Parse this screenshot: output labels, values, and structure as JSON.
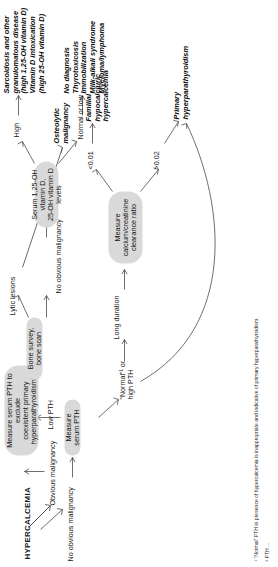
{
  "figure": {
    "root_label": "HYPERCALCEMIA",
    "type": "clinical-decision-flowchart"
  },
  "nodes": {
    "measure_pth_coexistent": "Measure serum PTH to exclude coexistent primary hyperparathyroidism²",
    "bone_survey": "Bone survey, bone scan",
    "serum_vitd": "Serum 1,25-OH vitamin D, 25-OH vitamin D levels",
    "measure_serum_pth": "Measure serum PTH",
    "measure_ratio": "Measure calcium/creatinine clearance ratio"
  },
  "node_lines": {
    "measure_pth_coexistent": [
      "Measure serum PTH to exclude",
      "coexistent primary",
      "hyperparathyroidism²"
    ],
    "bone_survey": [
      "Bone survey, bone scan"
    ],
    "serum_vitd": [
      "Serum 1,25-OH vitamin D,",
      "25-OH vitamin D levels"
    ],
    "measure_serum_pth": [
      "Measure serum PTH"
    ],
    "measure_ratio": [
      "Measure",
      "calcium/creatinine",
      "clearance ratio"
    ]
  },
  "edge_labels": {
    "obvious_malignancy": "Obvious malignancy",
    "no_obvious_malignancy_root": "No obvious malignancy",
    "low_pth": "Low PTH",
    "lytic_lesions": "Lytic lesions",
    "no_obvious_malignancy_2": "No obvious malignancy",
    "high": "High",
    "normal_or_low": "Normal or low",
    "normal_or_high_pth": [
      "“Normal”¹ or",
      "high PTH"
    ],
    "long_duration": "Long duration",
    "ratio_low": "<0.01",
    "ratio_high": ">0.02"
  },
  "terminals": {
    "osteolytic": [
      "Osteolytic",
      "malignancy"
    ],
    "sarcoid_block": [
      "Sarcoidosis and other",
      "granulomatous disease",
      "(high 1,25-OH vitamin D)",
      "Vitamin D intoxication",
      "(high 25-OH vitamin D)"
    ],
    "normal_low_block": [
      "No diagnosis",
      "Thyrotoxicosis",
      "Immobilization",
      "Milk-alkali syndrome",
      "Myeloma/lymphoma"
    ],
    "familial": [
      "Familial",
      "hypocalciuric",
      "hypercalcemia"
    ],
    "primary_hpt": [
      "Primary",
      "hyperparathyroidism"
    ]
  },
  "footnotes": {
    "one": "¹ “Normal” PTH in presence of hypercalcemia is inappropriate and indicative of primary hyperparathyroidism.",
    "two": "² PTH ..."
  },
  "colors": {
    "node_fill": "#d9d9d9",
    "edge_stroke": "#4a4a4a",
    "text": "#1a1a1a",
    "background": "#ffffff"
  }
}
